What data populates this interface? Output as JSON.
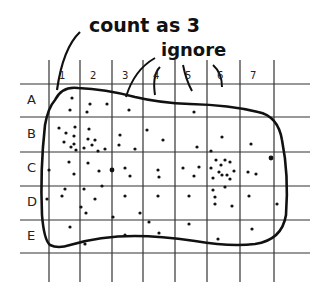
{
  "annotations": {
    "count_as": "count as 3",
    "ignore": "ignore"
  },
  "grid": {
    "columns": [
      "1",
      "2",
      "3",
      "4",
      "5",
      "6",
      "7"
    ],
    "rows": [
      "A",
      "B",
      "C",
      "D",
      "E"
    ],
    "vertical_lines_x": [
      49,
      80,
      112,
      143,
      175,
      207,
      240,
      274
    ],
    "horizontal_lines_y": [
      84,
      117,
      152,
      186,
      220,
      253
    ]
  },
  "colors": {
    "ink": "#111111",
    "grid": "#333333",
    "background": "#ffffff"
  },
  "dots": [
    [
      72,
      98
    ],
    [
      70,
      110
    ],
    [
      90,
      104
    ],
    [
      87,
      112
    ],
    [
      107,
      104
    ],
    [
      129,
      110
    ],
    [
      194,
      112
    ],
    [
      59,
      128
    ],
    [
      66,
      133
    ],
    [
      75,
      127
    ],
    [
      74,
      136
    ],
    [
      74,
      144
    ],
    [
      64,
      142
    ],
    [
      71,
      147
    ],
    [
      76,
      150
    ],
    [
      89,
      129
    ],
    [
      88,
      139
    ],
    [
      95,
      140
    ],
    [
      92,
      145
    ],
    [
      98,
      151
    ],
    [
      84,
      148
    ],
    [
      105,
      149
    ],
    [
      120,
      135
    ],
    [
      119,
      145
    ],
    [
      135,
      149
    ],
    [
      147,
      130
    ],
    [
      163,
      140
    ],
    [
      197,
      147
    ],
    [
      222,
      137
    ],
    [
      251,
      144
    ],
    [
      69,
      162
    ],
    [
      88,
      163
    ],
    [
      49,
      170
    ],
    [
      74,
      174
    ],
    [
      99,
      171
    ],
    [
      112,
      170
    ],
    [
      125,
      168
    ],
    [
      130,
      176
    ],
    [
      158,
      170
    ],
    [
      159,
      177
    ],
    [
      183,
      168
    ],
    [
      194,
      176
    ],
    [
      199,
      167
    ],
    [
      211,
      168
    ],
    [
      219,
      172
    ],
    [
      216,
      160
    ],
    [
      225,
      160
    ],
    [
      221,
      165
    ],
    [
      230,
      162
    ],
    [
      222,
      175
    ],
    [
      227,
      175
    ],
    [
      234,
      171
    ],
    [
      213,
      178
    ],
    [
      230,
      179
    ],
    [
      213,
      190
    ],
    [
      225,
      187
    ],
    [
      248,
      172
    ],
    [
      256,
      174
    ],
    [
      271,
      158
    ],
    [
      65,
      189
    ],
    [
      84,
      189
    ],
    [
      102,
      186
    ],
    [
      211,
      151
    ],
    [
      47,
      199
    ],
    [
      62,
      196
    ],
    [
      81,
      207
    ],
    [
      86,
      213
    ],
    [
      95,
      199
    ],
    [
      125,
      196
    ],
    [
      158,
      196
    ],
    [
      189,
      196
    ],
    [
      215,
      197
    ],
    [
      215,
      204
    ],
    [
      232,
      206
    ],
    [
      249,
      196
    ],
    [
      277,
      204
    ],
    [
      113,
      217
    ],
    [
      140,
      213
    ],
    [
      70,
      227
    ],
    [
      85,
      244
    ],
    [
      125,
      235
    ],
    [
      149,
      222
    ],
    [
      159,
      233
    ],
    [
      189,
      224
    ],
    [
      218,
      239
    ],
    [
      252,
      229
    ]
  ],
  "big_dots": [
    [
      112,
      170
    ],
    [
      271,
      158
    ]
  ]
}
